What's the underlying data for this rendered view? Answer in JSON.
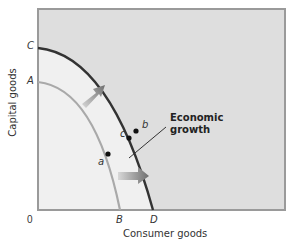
{
  "diagram": {
    "type": "production-possibilities-curve",
    "x_axis_label": "Consumer goods",
    "y_axis_label": "Capital goods",
    "origin_label": "0",
    "x_ticks": [
      "B",
      "D"
    ],
    "y_ticks": [
      "A",
      "C"
    ],
    "curves": [
      {
        "name": "inner-ppc",
        "from": "A",
        "to": "B",
        "color": "#a9a9a9"
      },
      {
        "name": "outer-ppc",
        "from": "C",
        "to": "D",
        "color": "#333333"
      }
    ],
    "points": [
      {
        "label": "a",
        "on": "inner-ppc"
      },
      {
        "label": "b",
        "on": "outer-ppc"
      },
      {
        "label": "c",
        "on": "between curves"
      }
    ],
    "annotation": {
      "line1": "Economic",
      "line2": "growth"
    },
    "colors": {
      "inside_fill": "#f0f0f0",
      "outside_fill": "#dedede",
      "frame": "#9a9a9a",
      "arrow": "#7a7a7a"
    }
  }
}
